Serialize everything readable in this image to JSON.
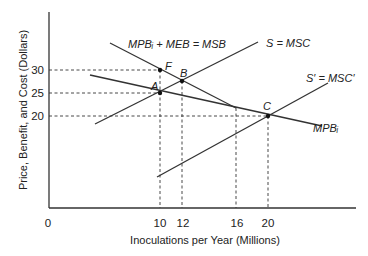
{
  "diagram": {
    "y_axis_label": "Price, Benefit, and Cost (Dollars)",
    "x_axis_label": "Inoculations per Year (Millions)",
    "origin_label": "0",
    "y_ticks": [
      "30",
      "25",
      "20"
    ],
    "x_ticks": [
      "10",
      "12",
      "16",
      "20"
    ],
    "curves": {
      "msb": "MPBᵢ + MEB = MSB",
      "msc": "S = MSC",
      "msc_prime": "S′ = MSC′",
      "mpb": "MPBᵢ"
    },
    "points": {
      "F": "F",
      "A": "A",
      "B": "B",
      "C": "C"
    },
    "colors": {
      "line": "#333333",
      "text": "#222222"
    }
  }
}
